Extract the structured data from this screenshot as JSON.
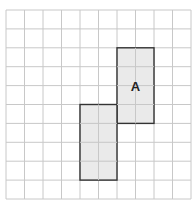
{
  "grid": {
    "cols": 10,
    "rows": 10,
    "origin_x": 6,
    "origin_y": 10,
    "cell_w": 18.5,
    "cell_h": 18.9,
    "line_color": "#c8c8c8"
  },
  "shape": {
    "label": "A",
    "fill": "#e6e6e6",
    "stroke": "#333333",
    "rects": [
      {
        "col": 6,
        "row": 2,
        "w": 2,
        "h": 4
      },
      {
        "col": 4,
        "row": 5,
        "w": 2,
        "h": 4
      }
    ],
    "label_col": 7,
    "label_row": 4
  }
}
